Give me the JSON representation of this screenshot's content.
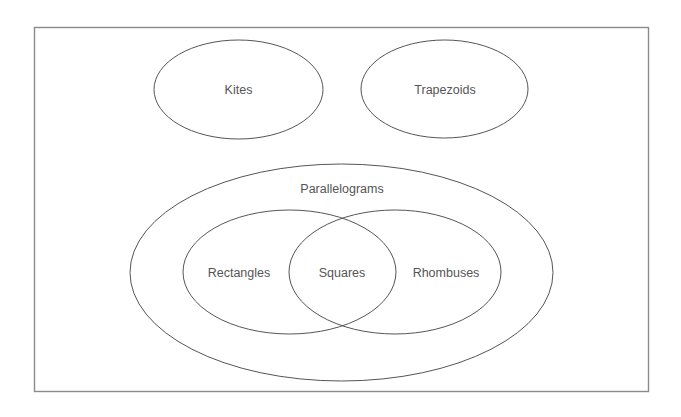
{
  "diagram": {
    "type": "venn-diagram",
    "universe": {
      "label": ""
    },
    "sets": [
      {
        "id": "kites",
        "label": "Kites",
        "contained_in": null
      },
      {
        "id": "trapezoids",
        "label": "Trapezoids",
        "contained_in": null
      },
      {
        "id": "parallelograms",
        "label": "Parallelograms",
        "contained_in": null
      },
      {
        "id": "rectangles",
        "label": "Rectangles",
        "contained_in": "parallelograms"
      },
      {
        "id": "rhombuses",
        "label": "Rhombuses",
        "contained_in": "parallelograms"
      }
    ],
    "intersections": [
      {
        "id": "squares",
        "label": "Squares",
        "of": [
          "rectangles",
          "rhombuses"
        ]
      }
    ],
    "colors": {
      "stroke": "#555555",
      "frame": "#8a8a8a",
      "text": "#555555",
      "background": "#ffffff"
    }
  }
}
